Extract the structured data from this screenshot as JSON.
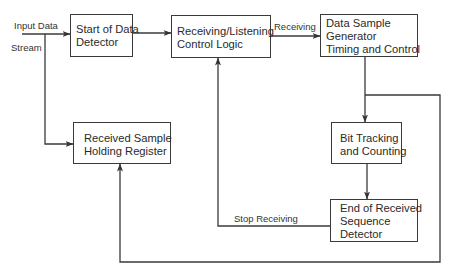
{
  "diagram": {
    "type": "block-diagram",
    "inputs": {
      "line1": "Input Data",
      "line2": "Stream"
    },
    "blocks": {
      "start_detector": {
        "lines": [
          "Start of Data",
          "Detector"
        ]
      },
      "control_logic": {
        "lines": [
          "Receiving/Listening",
          "Control Logic"
        ]
      },
      "sample_generator": {
        "lines": [
          "Data Sample",
          "Generator",
          "Timing and Control"
        ]
      },
      "holding_register": {
        "lines": [
          "Received Sample",
          "Holding Register"
        ]
      },
      "bit_tracking": {
        "lines": [
          "Bit Tracking",
          "and Counting"
        ]
      },
      "end_detector": {
        "lines": [
          "End of Received",
          "Sequence",
          "Detector"
        ]
      }
    },
    "edge_labels": {
      "receiving": "Receiving",
      "stop_receiving": "Stop Receiving"
    },
    "edges": [
      {
        "from": "input",
        "to": "start_detector"
      },
      {
        "from": "input",
        "to": "holding_register"
      },
      {
        "from": "start_detector",
        "to": "control_logic"
      },
      {
        "from": "control_logic",
        "to": "sample_generator",
        "label": "Receiving"
      },
      {
        "from": "sample_generator",
        "to": "bit_tracking"
      },
      {
        "from": "sample_generator",
        "to": "holding_register"
      },
      {
        "from": "bit_tracking",
        "to": "end_detector"
      },
      {
        "from": "end_detector",
        "to": "control_logic",
        "label": "Stop Receiving"
      }
    ],
    "colors": {
      "line": "#3a3a3a",
      "background": "#ffffff"
    }
  }
}
